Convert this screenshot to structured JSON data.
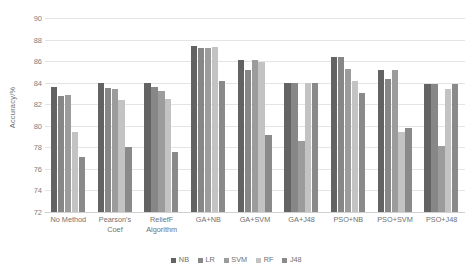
{
  "chart_data": {
    "type": "bar",
    "title": "",
    "xlabel": "",
    "ylabel": "Accuracy/%",
    "ylim": [
      72,
      90
    ],
    "ytick_step": 2,
    "yticks": [
      72,
      74,
      76,
      78,
      80,
      82,
      84,
      86,
      88,
      90
    ],
    "grid": true,
    "legend_position": "bottom",
    "categories": [
      "No Method",
      "Pearson's Coef",
      "ReliefF Algorithm",
      "GA+NB",
      "GA+SVM",
      "GA+J48",
      "PSO+NB",
      "PSO+SVM",
      "PSO+J48"
    ],
    "series": [
      {
        "name": "NB",
        "color": "#636363",
        "values": [
          83.6,
          84.0,
          84.0,
          87.4,
          86.1,
          84.0,
          86.4,
          85.2,
          83.9
        ]
      },
      {
        "name": "LR",
        "color": "#878787",
        "values": [
          82.8,
          83.5,
          83.6,
          87.2,
          85.2,
          84.0,
          86.4,
          84.3,
          83.9
        ]
      },
      {
        "name": "SVM",
        "color": "#9c9c9c",
        "values": [
          82.9,
          83.4,
          83.2,
          87.2,
          86.1,
          78.6,
          85.3,
          85.2,
          78.1
        ]
      },
      {
        "name": "RF",
        "color": "#c3c3c3",
        "values": [
          79.4,
          82.4,
          82.5,
          87.3,
          85.9,
          84.0,
          84.2,
          79.4,
          83.4
        ]
      },
      {
        "name": "J48",
        "color": "#8a8a8a",
        "values": [
          77.1,
          78.0,
          77.6,
          84.2,
          79.1,
          84.0,
          83.0,
          79.8,
          83.9
        ]
      }
    ]
  },
  "axis": {
    "y_title": "Accuracy/%"
  }
}
